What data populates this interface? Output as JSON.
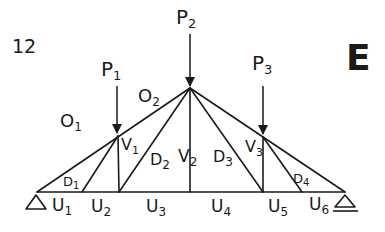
{
  "figure": {
    "number": "12",
    "letter": "E"
  },
  "loads": [
    {
      "id": "P1",
      "label": "P",
      "sub": "1"
    },
    {
      "id": "P2",
      "label": "P",
      "sub": "2"
    },
    {
      "id": "P3",
      "label": "P",
      "sub": "3"
    }
  ],
  "members": {
    "top_chords": [
      {
        "id": "O1",
        "label": "O",
        "sub": "1"
      },
      {
        "id": "O2",
        "label": "O",
        "sub": "2"
      }
    ],
    "verticals": [
      {
        "id": "V1",
        "label": "V",
        "sub": "1"
      },
      {
        "id": "V2",
        "label": "V",
        "sub": "2"
      },
      {
        "id": "V3",
        "label": "V",
        "sub": "3"
      }
    ],
    "diagonals": [
      {
        "id": "D1",
        "label": "D",
        "sub": "1"
      },
      {
        "id": "D2",
        "label": "D",
        "sub": "2"
      },
      {
        "id": "D3",
        "label": "D",
        "sub": "3"
      },
      {
        "id": "D4",
        "label": "D",
        "sub": "4"
      }
    ],
    "bottom_chords": [
      {
        "id": "U1",
        "label": "U",
        "sub": "1"
      },
      {
        "id": "U2",
        "label": "U",
        "sub": "2"
      },
      {
        "id": "U3",
        "label": "U",
        "sub": "3"
      },
      {
        "id": "U4",
        "label": "U",
        "sub": "4"
      },
      {
        "id": "U5",
        "label": "U",
        "sub": "5"
      },
      {
        "id": "U6",
        "label": "U",
        "sub": "6"
      }
    ]
  },
  "supports": [
    {
      "id": "left",
      "type": "pinned"
    },
    {
      "id": "right",
      "type": "roller"
    }
  ],
  "colors": {
    "ink": "#1a1a1a",
    "background": "#ffffff"
  }
}
